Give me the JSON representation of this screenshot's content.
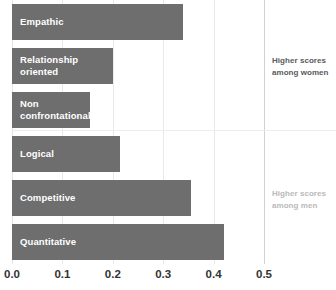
{
  "chart_data": {
    "type": "bar",
    "orientation": "horizontal",
    "title": "",
    "subtitle": "",
    "xlabel": "",
    "ylabel": "",
    "xlim": [
      0.0,
      0.5
    ],
    "xticks": [
      "0.0",
      "0.1",
      "0.2",
      "0.3",
      "0.4",
      "0.5"
    ],
    "xtick_values": [
      0.0,
      0.1,
      0.2,
      0.3,
      0.4,
      0.5
    ],
    "grid": true,
    "legend": "none",
    "categories": [
      "Empathic",
      "Relationship\noriented",
      "Non\nconfrontational",
      "Logical",
      "Competitive",
      "Quantitative"
    ],
    "values": [
      0.34,
      0.2,
      0.155,
      0.215,
      0.355,
      0.42
    ],
    "bar_color": "#6e6e6e",
    "bar_label_color": "#ffffff",
    "annotations": [
      {
        "name": "higher-scores-women",
        "text": "Higher scores\namong women",
        "color": "#5a5a5a",
        "group_categories": [
          "Empathic",
          "Relationship oriented",
          "Non confrontational"
        ]
      },
      {
        "name": "higher-scores-men",
        "text": "Higher scores\namong men",
        "color": "#b9b9b9",
        "group_categories": [
          "Logical",
          "Competitive",
          "Quantitative"
        ]
      }
    ],
    "divider": {
      "after_category": "Non confrontational",
      "color": "#ededed"
    }
  }
}
